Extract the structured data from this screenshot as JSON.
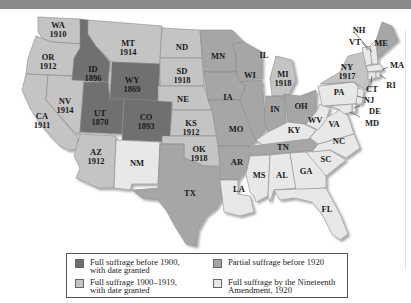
{
  "colors": {
    "full_before_1900": "#6f6f6f",
    "full_1900_1919": "#c4c4c4",
    "partial_before_1920": "#a6a6a6",
    "nineteenth_amendment": "#e8e8e8"
  },
  "states": {
    "WA": {
      "abbr": "WA",
      "year": "1910"
    },
    "OR": {
      "abbr": "OR",
      "year": "1912"
    },
    "CA": {
      "abbr": "CA",
      "year": "1911"
    },
    "ID": {
      "abbr": "ID",
      "year": "1896"
    },
    "NV": {
      "abbr": "NV",
      "year": "1914"
    },
    "MT": {
      "abbr": "MT",
      "year": "1914"
    },
    "WY": {
      "abbr": "WY",
      "year": "1869"
    },
    "UT": {
      "abbr": "UT",
      "year": "1870"
    },
    "CO": {
      "abbr": "CO",
      "year": "1893"
    },
    "AZ": {
      "abbr": "AZ",
      "year": "1912"
    },
    "NM": {
      "abbr": "NM"
    },
    "ND": {
      "abbr": "ND"
    },
    "SD": {
      "abbr": "SD",
      "year": "1918"
    },
    "NE": {
      "abbr": "NE"
    },
    "KS": {
      "abbr": "KS",
      "year": "1912"
    },
    "OK": {
      "abbr": "OK",
      "year": "1918"
    },
    "TX": {
      "abbr": "TX"
    },
    "MN": {
      "abbr": "MN"
    },
    "IA": {
      "abbr": "IA"
    },
    "MO": {
      "abbr": "MO"
    },
    "AR": {
      "abbr": "AR"
    },
    "LA": {
      "abbr": "LA"
    },
    "WI": {
      "abbr": "WI"
    },
    "IL": {
      "abbr": "IL"
    },
    "MI": {
      "abbr": "MI",
      "year": "1918"
    },
    "IN": {
      "abbr": "IN"
    },
    "OH": {
      "abbr": "OH"
    },
    "KY": {
      "abbr": "KY"
    },
    "TN": {
      "abbr": "TN"
    },
    "MS": {
      "abbr": "MS"
    },
    "AL": {
      "abbr": "AL"
    },
    "GA": {
      "abbr": "GA"
    },
    "FL": {
      "abbr": "FL"
    },
    "SC": {
      "abbr": "SC"
    },
    "NC": {
      "abbr": "NC"
    },
    "VA": {
      "abbr": "VA"
    },
    "WV": {
      "abbr": "WV"
    },
    "PA": {
      "abbr": "PA"
    },
    "NY": {
      "abbr": "NY",
      "year": "1917"
    },
    "VT": {
      "abbr": "VT"
    },
    "NH": {
      "abbr": "NH"
    },
    "ME": {
      "abbr": "ME"
    },
    "MA": {
      "abbr": "MA"
    },
    "RI": {
      "abbr": "RI"
    },
    "CT": {
      "abbr": "CT"
    },
    "NJ": {
      "abbr": "NJ"
    },
    "DE": {
      "abbr": "DE"
    },
    "MD": {
      "abbr": "MD"
    }
  },
  "legend": {
    "items": [
      {
        "line1": "Full suffrage before 1900,",
        "line2": "with date granted"
      },
      {
        "line1": "Partial suffrage before 1920",
        "line2": ""
      },
      {
        "line1": "Full suffrage 1900–1919,",
        "line2": "with date granted"
      },
      {
        "line1": "Full suffrage by the Nineteenth",
        "line2": "Amendment, 1920"
      }
    ]
  }
}
